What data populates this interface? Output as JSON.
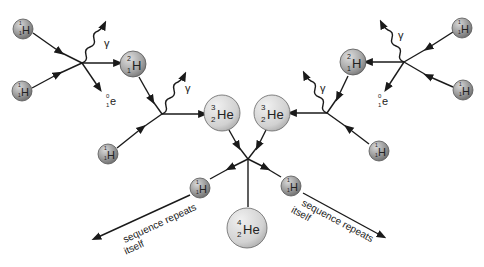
{
  "colors": {
    "line": "#1a1a1a",
    "sphere_dark": "#8a8a8a",
    "sphere_light": "#e4e4e4",
    "text": "#222222"
  },
  "nuclei": {
    "h1": {
      "symbol": "H",
      "mass": "1",
      "atomic": "1"
    },
    "h2": {
      "symbol": "H",
      "mass": "2",
      "atomic": "1"
    },
    "he3": {
      "symbol": "He",
      "mass": "3",
      "atomic": "2"
    },
    "he4": {
      "symbol": "He",
      "mass": "4",
      "atomic": "2"
    }
  },
  "particles": {
    "gamma": "γ",
    "positron": {
      "symbol": "e",
      "mass": "0",
      "charge": "1"
    }
  },
  "labels": {
    "repeat_line1": "sequence repeats",
    "repeat_line2": "itself"
  }
}
